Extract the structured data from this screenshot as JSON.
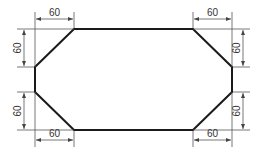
{
  "drawing": {
    "shape": "chamfered-rectangle",
    "outline_color": "#1a1a1a",
    "dimension_color": "#555555",
    "vertices": [
      [
        74,
        29
      ],
      [
        193,
        29
      ],
      [
        232,
        67
      ],
      [
        232,
        92
      ],
      [
        193,
        130
      ],
      [
        74,
        130
      ],
      [
        35,
        92
      ],
      [
        35,
        67
      ]
    ]
  },
  "dimensions": {
    "top_left_horizontal": "60",
    "top_right_horizontal": "60",
    "bottom_left_horizontal": "60",
    "bottom_right_horizontal": "60",
    "left_top_vertical": "60",
    "left_bottom_vertical": "60",
    "right_top_vertical": "60",
    "right_bottom_vertical": "60"
  }
}
